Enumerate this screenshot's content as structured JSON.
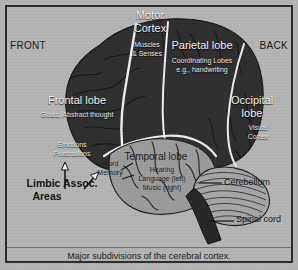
{
  "figure": {
    "caption": "Major subdivisions of the cerebral cortex.",
    "orientation": {
      "front": "FRONT",
      "back": "BACK"
    }
  },
  "regions": {
    "motor_cortex": {
      "title": "Motor\nCortex",
      "title_line1": "Motor",
      "title_line2": "Cortex",
      "sub_line1": "Muscles",
      "sub_line2": "& Senses"
    },
    "parietal_lobe": {
      "title": "Parietal lobe",
      "sub_line1": "Coordinating Lobes",
      "sub_line2": "e.g., handwriting"
    },
    "occipital_lobe": {
      "title_line1": "Occipital",
      "title_line2": "lobe",
      "sub_line1": "Visual",
      "sub_line2": "Cortex"
    },
    "frontal_lobe": {
      "title": "Frontal lobe",
      "sub_line1": "Goals, Abstract thought"
    },
    "limbic_area": {
      "inline_line1": "Emotions",
      "inline_line2": "Frustrations",
      "callout_line1": "Limbic Assoc.",
      "callout_line2": "Areas"
    },
    "temporal_lobe": {
      "title": "Temporal lobe",
      "sub_line1": "Hearing",
      "sub_line2": "Language (left)",
      "sub_line3": "Music (right)",
      "word_memory_line1": "Word",
      "word_memory_line2": "Memory"
    },
    "cerebellum": {
      "title": "Cerebellum"
    },
    "spinal_cord": {
      "title": "Spinal cord"
    }
  },
  "colors": {
    "paper": "#b4b4b4",
    "frame": "#2b2b2b",
    "cortex_dark": "#2f2f2f",
    "temporal_light": "#9a9a9a",
    "cerebellum": "#a5a5a5",
    "brainstem_dark": "#272727",
    "sulcus_white": "#e8e8e8",
    "label_light": "#f2f2f2",
    "label_dark": "#161616"
  }
}
